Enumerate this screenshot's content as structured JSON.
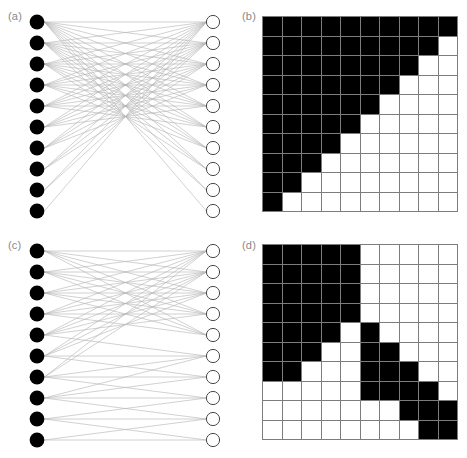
{
  "figure": {
    "panels": [
      {
        "id": "a",
        "label": "(a)",
        "type": "bipartite-network",
        "structure": "nested"
      },
      {
        "id": "b",
        "label": "(b)",
        "type": "interaction-matrix",
        "structure": "nested"
      },
      {
        "id": "c",
        "label": "(c)",
        "type": "bipartite-network",
        "structure": "modular"
      },
      {
        "id": "d",
        "label": "(d)",
        "type": "interaction-matrix",
        "structure": "modular"
      }
    ]
  },
  "colors": {
    "filled_cell": "#000000",
    "empty_cell": "#ffffff",
    "grid_line": "#7d7d7d",
    "label_text": "#8a8a8a",
    "left_node_fill": "#000000",
    "right_node_fill": "#ffffff",
    "right_node_stroke": "#333333",
    "edge": "#b4b4b4"
  },
  "chart_data": [
    {
      "type": "heatmap",
      "panel": "b",
      "title": "(b)",
      "structure": "nested",
      "rows": 10,
      "cols": 10,
      "xlabel": "",
      "ylabel": "",
      "grid": true,
      "legend": "none",
      "value_meaning": {
        "1": "interaction present (black)",
        "0": "no interaction (white)"
      },
      "matrix": [
        [
          1,
          1,
          1,
          1,
          1,
          1,
          1,
          1,
          1,
          1
        ],
        [
          1,
          1,
          1,
          1,
          1,
          1,
          1,
          1,
          1,
          0
        ],
        [
          1,
          1,
          1,
          1,
          1,
          1,
          1,
          1,
          0,
          0
        ],
        [
          1,
          1,
          1,
          1,
          1,
          1,
          1,
          0,
          0,
          0
        ],
        [
          1,
          1,
          1,
          1,
          1,
          1,
          0,
          0,
          0,
          0
        ],
        [
          1,
          1,
          1,
          1,
          1,
          0,
          0,
          0,
          0,
          0
        ],
        [
          1,
          1,
          1,
          1,
          0,
          0,
          0,
          0,
          0,
          0
        ],
        [
          1,
          1,
          1,
          0,
          0,
          0,
          0,
          0,
          0,
          0
        ],
        [
          1,
          1,
          0,
          0,
          0,
          0,
          0,
          0,
          0,
          0
        ],
        [
          1,
          0,
          0,
          0,
          0,
          0,
          0,
          0,
          0,
          0
        ]
      ],
      "row_degrees": [
        10,
        9,
        8,
        7,
        6,
        5,
        4,
        3,
        2,
        1
      ],
      "col_degrees": [
        10,
        9,
        8,
        7,
        6,
        5,
        4,
        3,
        2,
        1
      ]
    },
    {
      "type": "heatmap",
      "panel": "d",
      "title": "(d)",
      "structure": "modular",
      "rows": 10,
      "cols": 10,
      "xlabel": "",
      "ylabel": "",
      "grid": true,
      "legend": "none",
      "value_meaning": {
        "1": "interaction present (black)",
        "0": "no interaction (white)"
      },
      "matrix": [
        [
          1,
          1,
          1,
          1,
          1,
          0,
          0,
          0,
          0,
          0
        ],
        [
          1,
          1,
          1,
          1,
          1,
          0,
          0,
          0,
          0,
          0
        ],
        [
          1,
          1,
          1,
          1,
          1,
          0,
          0,
          0,
          0,
          0
        ],
        [
          1,
          1,
          1,
          1,
          1,
          0,
          0,
          0,
          0,
          0
        ],
        [
          1,
          1,
          1,
          1,
          0,
          1,
          0,
          0,
          0,
          0
        ],
        [
          1,
          1,
          1,
          0,
          0,
          1,
          1,
          0,
          0,
          0
        ],
        [
          1,
          1,
          0,
          0,
          0,
          1,
          1,
          1,
          0,
          0
        ],
        [
          0,
          0,
          0,
          0,
          0,
          1,
          1,
          1,
          1,
          0
        ],
        [
          0,
          0,
          0,
          0,
          0,
          0,
          0,
          1,
          1,
          1
        ],
        [
          0,
          0,
          0,
          0,
          0,
          0,
          0,
          0,
          1,
          1
        ]
      ],
      "row_degrees": [
        5,
        5,
        5,
        5,
        5,
        5,
        5,
        4,
        3,
        2
      ],
      "modules": 2
    },
    {
      "type": "bipartite-graph",
      "panel": "a",
      "title": "(a)",
      "structure": "nested",
      "left_nodes": 10,
      "right_nodes": 10,
      "left_node_style": "filled-black-circle",
      "right_node_style": "open-white-circle",
      "edges_from_matrix": "chart_data.0.matrix",
      "edge_count": 55
    },
    {
      "type": "bipartite-graph",
      "panel": "c",
      "title": "(c)",
      "structure": "modular",
      "left_nodes": 10,
      "right_nodes": 10,
      "left_node_style": "filled-black-circle",
      "right_node_style": "open-white-circle",
      "edges_from_matrix": "chart_data.1.matrix",
      "edge_count": 44
    }
  ]
}
